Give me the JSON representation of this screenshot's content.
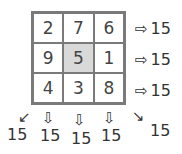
{
  "magic_square": {
    "cells": [
      [
        2,
        7,
        6
      ],
      [
        9,
        5,
        1
      ],
      [
        4,
        3,
        8
      ]
    ],
    "highlighted_cell": [
      1,
      1
    ],
    "highlight_color": "#d9d9d9",
    "border_color": "#7a7a7a"
  },
  "row_sums": [
    "15",
    "15",
    "15"
  ],
  "column_sums": [
    "15",
    "15",
    "15"
  ],
  "diagonal_sums": {
    "anti_diagonal": "15",
    "main_diagonal": "15"
  },
  "icons": {
    "right": "⇨",
    "down": "⇩",
    "down_left": "↙",
    "down_right": "↘"
  }
}
